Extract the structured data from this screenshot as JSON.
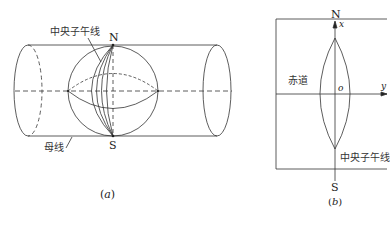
{
  "panel_a": {
    "caption": "(a)",
    "labels": {
      "central_meridian": "中央子午线",
      "north": "N",
      "south": "S",
      "generatrix": "母线"
    }
  },
  "panel_b": {
    "caption": "(b)",
    "labels": {
      "north": "N",
      "south": "S",
      "x_axis": "x",
      "y_axis": "y",
      "origin": "o",
      "equator": "赤道",
      "central_meridian": "中央子午线"
    }
  },
  "colors": {
    "stroke": "#333333",
    "background": "#ffffff"
  }
}
